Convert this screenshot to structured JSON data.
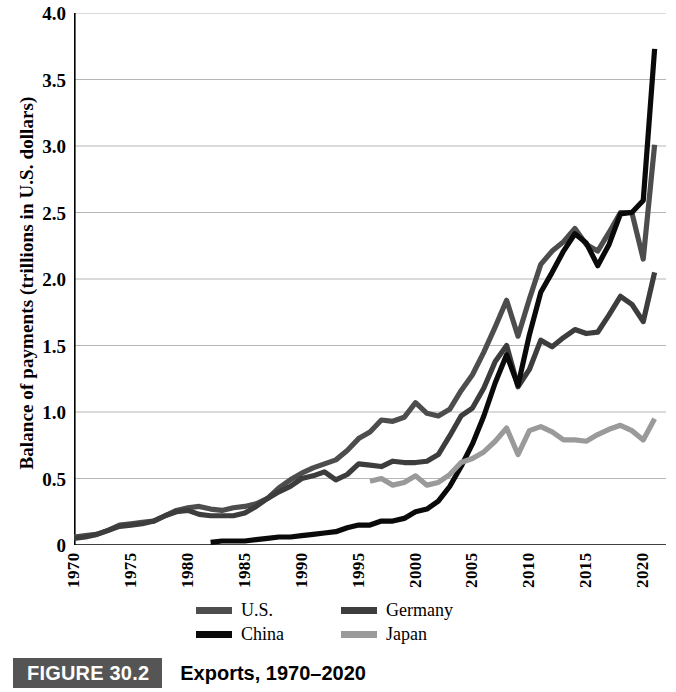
{
  "figure": {
    "number_label": "FIGURE 30.2",
    "caption_title": "Exports, 1970–2020",
    "number_box_color": "#555555"
  },
  "axes": {
    "y_title": "Balance of payments (trillions in U.S. dollars)",
    "y_ticks": [
      "0",
      "0.5",
      "1.0",
      "1.5",
      "2.0",
      "2.5",
      "3.0",
      "3.5",
      "4.0"
    ],
    "x_ticks": [
      "1970",
      "1975",
      "1980",
      "1985",
      "1990",
      "1995",
      "2000",
      "2005",
      "2010",
      "2015",
      "2020"
    ]
  },
  "legend": {
    "items": [
      {
        "label": "U.S.",
        "color": "#4d4d4d"
      },
      {
        "label": "Germany",
        "color": "#3d3d3d"
      },
      {
        "label": "China",
        "color": "#0a0a0a"
      },
      {
        "label": "Japan",
        "color": "#9a9a9a"
      }
    ]
  },
  "chart_data": {
    "type": "line",
    "title": "Exports, 1970–2020",
    "xlabel": "",
    "ylabel": "Balance of payments (trillions in U.S. dollars)",
    "xlim": [
      1970,
      2022
    ],
    "ylim": [
      0,
      4.0
    ],
    "y_tick_values": [
      0,
      0.5,
      1.0,
      1.5,
      2.0,
      2.5,
      3.0,
      3.5,
      4.0
    ],
    "x_tick_values": [
      1970,
      1975,
      1980,
      1985,
      1990,
      1995,
      2000,
      2005,
      2010,
      2015,
      2020
    ],
    "grid": "horizontal",
    "legend_position": "below-axis",
    "series": [
      {
        "name": "U.S.",
        "color": "#4d4d4d",
        "x": [
          1970,
          1971,
          1972,
          1973,
          1974,
          1975,
          1976,
          1977,
          1978,
          1979,
          1980,
          1981,
          1982,
          1983,
          1984,
          1985,
          1986,
          1987,
          1988,
          1989,
          1990,
          1991,
          1992,
          1993,
          1994,
          1995,
          1996,
          1997,
          1998,
          1999,
          2000,
          2001,
          2002,
          2003,
          2004,
          2005,
          2006,
          2007,
          2008,
          2009,
          2010,
          2011,
          2012,
          2013,
          2014,
          2015,
          2016,
          2017,
          2018,
          2019,
          2020,
          2021
        ],
        "values": [
          0.06,
          0.07,
          0.08,
          0.11,
          0.15,
          0.16,
          0.17,
          0.18,
          0.22,
          0.26,
          0.28,
          0.29,
          0.27,
          0.26,
          0.28,
          0.29,
          0.31,
          0.35,
          0.43,
          0.49,
          0.54,
          0.58,
          0.61,
          0.64,
          0.71,
          0.8,
          0.85,
          0.94,
          0.93,
          0.96,
          1.07,
          0.99,
          0.97,
          1.02,
          1.16,
          1.28,
          1.45,
          1.64,
          1.84,
          1.57,
          1.85,
          2.11,
          2.21,
          2.28,
          2.38,
          2.26,
          2.21,
          2.35,
          2.5,
          2.5,
          2.15,
          3.01
        ]
      },
      {
        "name": "Germany",
        "color": "#3d3d3d",
        "x": [
          1970,
          1971,
          1972,
          1973,
          1974,
          1975,
          1976,
          1977,
          1978,
          1979,
          1980,
          1981,
          1982,
          1983,
          1984,
          1985,
          1986,
          1987,
          1988,
          1989,
          1990,
          1991,
          1992,
          1993,
          1994,
          1995,
          1996,
          1997,
          1998,
          1999,
          2000,
          2001,
          2002,
          2003,
          2004,
          2005,
          2006,
          2007,
          2008,
          2009,
          2010,
          2011,
          2012,
          2013,
          2014,
          2015,
          2016,
          2017,
          2018,
          2019,
          2020,
          2021
        ],
        "values": [
          0.05,
          0.06,
          0.08,
          0.11,
          0.14,
          0.15,
          0.16,
          0.18,
          0.22,
          0.25,
          0.26,
          0.23,
          0.22,
          0.22,
          0.22,
          0.24,
          0.29,
          0.35,
          0.4,
          0.44,
          0.5,
          0.52,
          0.55,
          0.49,
          0.53,
          0.61,
          0.6,
          0.59,
          0.63,
          0.62,
          0.62,
          0.63,
          0.68,
          0.82,
          0.97,
          1.03,
          1.18,
          1.38,
          1.5,
          1.19,
          1.32,
          1.54,
          1.49,
          1.56,
          1.62,
          1.59,
          1.6,
          1.73,
          1.87,
          1.81,
          1.68,
          2.05
        ]
      },
      {
        "name": "China",
        "color": "#0a0a0a",
        "x": [
          1982,
          1983,
          1984,
          1985,
          1986,
          1987,
          1988,
          1989,
          1990,
          1991,
          1992,
          1993,
          1994,
          1995,
          1996,
          1997,
          1998,
          1999,
          2000,
          2001,
          2002,
          2003,
          2004,
          2005,
          2006,
          2007,
          2008,
          2009,
          2010,
          2011,
          2012,
          2013,
          2014,
          2015,
          2016,
          2017,
          2018,
          2019,
          2020,
          2021
        ],
        "values": [
          0.02,
          0.03,
          0.03,
          0.03,
          0.04,
          0.05,
          0.06,
          0.06,
          0.07,
          0.08,
          0.09,
          0.1,
          0.13,
          0.15,
          0.15,
          0.18,
          0.18,
          0.2,
          0.25,
          0.27,
          0.33,
          0.44,
          0.59,
          0.76,
          0.97,
          1.22,
          1.43,
          1.2,
          1.58,
          1.9,
          2.05,
          2.21,
          2.34,
          2.27,
          2.1,
          2.26,
          2.49,
          2.5,
          2.59,
          3.73
        ]
      },
      {
        "name": "Japan",
        "color": "#9a9a9a",
        "x": [
          1996,
          1997,
          1998,
          1999,
          2000,
          2001,
          2002,
          2003,
          2004,
          2005,
          2006,
          2007,
          2008,
          2009,
          2010,
          2011,
          2012,
          2013,
          2014,
          2015,
          2016,
          2017,
          2018,
          2019,
          2020,
          2021
        ],
        "values": [
          0.48,
          0.5,
          0.45,
          0.47,
          0.52,
          0.45,
          0.47,
          0.53,
          0.62,
          0.65,
          0.7,
          0.78,
          0.88,
          0.68,
          0.86,
          0.89,
          0.85,
          0.79,
          0.79,
          0.78,
          0.83,
          0.87,
          0.9,
          0.86,
          0.79,
          0.95
        ]
      }
    ]
  }
}
